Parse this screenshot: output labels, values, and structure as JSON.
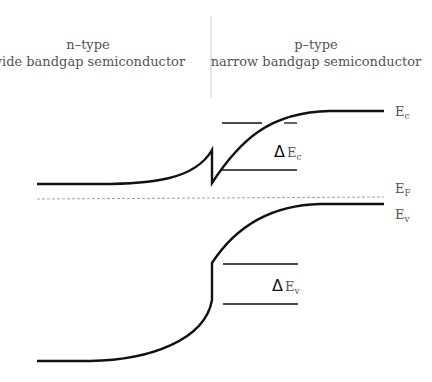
{
  "left_region": {
    "line1": "n–type",
    "line2": "wide bandgap semiconductor"
  },
  "right_region": {
    "line1": "p–type",
    "line2": "narrow bandgap semiconductor"
  },
  "labels": {
    "Ec": {
      "main": "E",
      "sub": "c"
    },
    "EF": {
      "main": "E",
      "sub": "F"
    },
    "Ev": {
      "main": "E",
      "sub": "v"
    },
    "dEc": {
      "delta": "Δ",
      "main": "E",
      "sub": "c"
    },
    "dEv": {
      "delta": "Δ",
      "main": "E",
      "sub": "v"
    }
  },
  "colors": {
    "line": "#111111",
    "text": "#555555",
    "fermi": "#888888",
    "divider": "#cccccc"
  }
}
